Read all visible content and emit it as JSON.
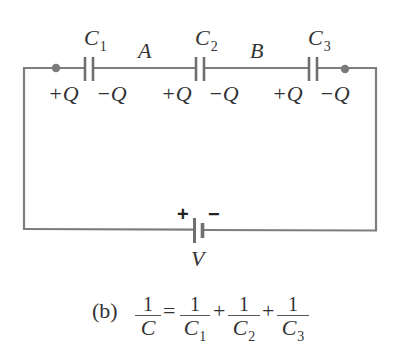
{
  "figure": {
    "panel_label": "(b)",
    "colors": {
      "wire": "#7d7d7d",
      "node_dot": "#7a7a7a",
      "text": "#333333",
      "background": "#ffffff"
    }
  },
  "circuit": {
    "capacitors": [
      {
        "name": "C",
        "subscript": "1",
        "left_charge": "+Q",
        "right_charge": "−Q"
      },
      {
        "name": "C",
        "subscript": "2",
        "left_charge": "+Q",
        "right_charge": "−Q"
      },
      {
        "name": "C",
        "subscript": "3",
        "left_charge": "+Q",
        "right_charge": "−Q"
      }
    ],
    "nodes": [
      {
        "label": "A"
      },
      {
        "label": "B"
      }
    ],
    "battery": {
      "label": "V",
      "positive": "+",
      "negative": "−"
    }
  },
  "equation": {
    "lhs": {
      "numerator": "1",
      "denominator": "C",
      "subscript": ""
    },
    "equals": "=",
    "plus": "+",
    "terms": [
      {
        "numerator": "1",
        "denominator": "C",
        "subscript": "1"
      },
      {
        "numerator": "1",
        "denominator": "C",
        "subscript": "2"
      },
      {
        "numerator": "1",
        "denominator": "C",
        "subscript": "3"
      }
    ]
  }
}
